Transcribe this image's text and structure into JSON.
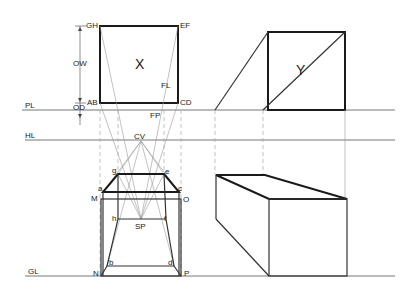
{
  "diagram": {
    "type": "perspective-construction",
    "colors": {
      "line": "#1a1a1a",
      "reference_line": "#777777",
      "projector": "#aaaaaa",
      "background": "#ffffff"
    },
    "reference_lines": [
      {
        "id": "PL",
        "label": "PL"
      },
      {
        "id": "HL",
        "label": "HL"
      },
      {
        "id": "GL",
        "label": "GL"
      }
    ],
    "plan_view": {
      "label": "X",
      "corners": {
        "top_left": "GH",
        "top_right": "EF",
        "bottom_left": "AB",
        "bottom_right": "CD"
      },
      "annotations": {
        "object_width": "OW",
        "object_distance": "OD",
        "fl": "FL",
        "fp": "FP"
      }
    },
    "side_view": {
      "label": "Y"
    },
    "perspective_view": {
      "centre_of_vision": "CV",
      "station_point": "SP",
      "points": {
        "g": "g",
        "e": "e",
        "a": "a",
        "c": "c",
        "M": "M",
        "O": "O",
        "h": "h",
        "f": "f",
        "b": "b",
        "d": "d",
        "N": "N",
        "P": "P"
      }
    }
  }
}
